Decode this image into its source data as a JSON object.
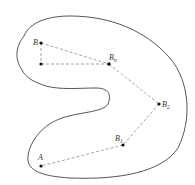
{
  "diagram": {
    "type": "region-path-illustration",
    "colors": {
      "outline": "#555555",
      "dash": "#9a9a9a",
      "point": "#111111"
    },
    "points": [
      {
        "id": "B",
        "label": "B",
        "sub": "",
        "x": 41,
        "y": 43
      },
      {
        "id": "P",
        "label": "",
        "sub": "",
        "x": 41,
        "y": 64
      },
      {
        "id": "Bn",
        "label": "B",
        "sub": "n",
        "x": 109,
        "y": 64
      },
      {
        "id": "B2",
        "label": "B",
        "sub": "2",
        "x": 159,
        "y": 104
      },
      {
        "id": "B1",
        "label": "B",
        "sub": "1",
        "x": 123,
        "y": 145
      },
      {
        "id": "A",
        "label": "A",
        "sub": "",
        "x": 41,
        "y": 166
      }
    ],
    "labels": {
      "B": "B",
      "Bn": "B",
      "Bn_sub": "n",
      "B2": "B",
      "B2_sub": "2",
      "B1": "B",
      "B1_sub": "1",
      "A": "A"
    }
  }
}
